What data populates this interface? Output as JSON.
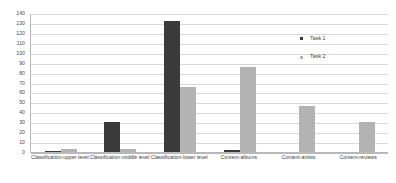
{
  "chart_data": {
    "type": "bar",
    "title": "",
    "subtitle": "",
    "xlabel": "",
    "ylabel": "",
    "ylim": [
      0,
      140
    ],
    "ytick_step": 10,
    "yticks": [
      0,
      10,
      20,
      30,
      40,
      50,
      60,
      70,
      80,
      90,
      100,
      110,
      120,
      130,
      140
    ],
    "ytick_labels": [
      "0",
      "10",
      "20",
      "30",
      "40",
      "50",
      "60",
      "70",
      "80",
      "90",
      "100",
      "110",
      "120",
      "130",
      "140"
    ],
    "grid": true,
    "grid_axis": "y",
    "legend_position": "inside-upper-right",
    "categories": [
      "Classification-upper level",
      "Classification-middle level",
      "Classification-lower level",
      "Content-albums",
      "Content-artists",
      "Content-reviews"
    ],
    "series": [
      {
        "name": "Task 1",
        "color": "#3a3a3a",
        "values": [
          1,
          30,
          132,
          2,
          0,
          0
        ]
      },
      {
        "name": "Task 2",
        "color": "#b3b3b3",
        "values": [
          3,
          3,
          65,
          86,
          46,
          30
        ]
      }
    ]
  },
  "legend": {
    "entries": [
      {
        "label": "Task 1"
      },
      {
        "label": "Task 2"
      }
    ]
  },
  "colors": {
    "series_1": "#3a3a3a",
    "series_2": "#b3b3b3",
    "gridline": "#d9d9d9",
    "axis": "#b8b8b8",
    "background": "#ffffff",
    "text": "#3d3d3d"
  }
}
